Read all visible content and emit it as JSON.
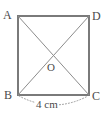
{
  "figure": {
    "type": "square-with-diagonals",
    "colors": {
      "square_stroke": "#7a7a7a",
      "diagonal_stroke": "#8c8c8c",
      "dimension_stroke": "#9a9a9a",
      "text": "#4a4a4a",
      "background": "#ffffff"
    },
    "vertices": [
      {
        "id": "A",
        "label": "A",
        "position": "top-left",
        "x": 18,
        "y": 16
      },
      {
        "id": "D",
        "label": "D",
        "position": "top-right",
        "x": 89,
        "y": 16
      },
      {
        "id": "B",
        "label": "B",
        "position": "bottom-left",
        "x": 18,
        "y": 95
      },
      {
        "id": "C",
        "label": "C",
        "position": "bottom-right",
        "x": 89,
        "y": 95
      }
    ],
    "center": {
      "id": "O",
      "label": "O",
      "x": 53,
      "y": 56
    },
    "diagonals": [
      {
        "from": "A",
        "to": "C"
      },
      {
        "from": "D",
        "to": "B"
      }
    ],
    "dimension": {
      "label": "4 cm",
      "value": 4,
      "unit": "cm",
      "measures": "BC",
      "style": "dotted-arc",
      "position": "below"
    }
  }
}
